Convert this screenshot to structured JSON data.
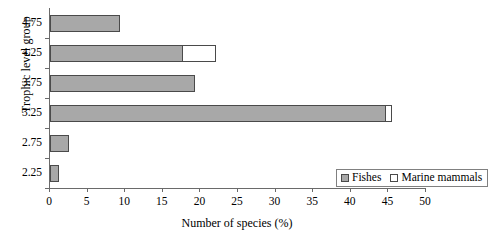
{
  "chart_data": {
    "type": "bar",
    "orientation": "horizontal",
    "stacked": true,
    "title": "",
    "xlabel": "Number of species (%)",
    "ylabel": "Trophic level group",
    "categories": [
      "2.25",
      "2.75",
      "3.25",
      "3.75",
      "4.25",
      "4.75"
    ],
    "series": [
      {
        "name": "Fishes",
        "color": "#a8a8a8",
        "values": [
          1.2,
          2.5,
          44.7,
          19.3,
          17.7,
          9.3
        ]
      },
      {
        "name": "Marine mammals",
        "color": "#ffffff",
        "values": [
          0,
          0,
          0.9,
          0,
          4.5,
          0
        ]
      }
    ],
    "xlim": [
      0,
      50
    ],
    "xticks": [
      0,
      5,
      10,
      15,
      20,
      25,
      30,
      35,
      40,
      45,
      50
    ],
    "xtick_labels": [
      "0",
      "5",
      "10",
      "15",
      "20",
      "25",
      "30",
      "35",
      "40",
      "45",
      "50"
    ],
    "ytick_labels": [
      "4.75",
      "4.25",
      "3.75",
      "3.25",
      "2.75",
      "2.25"
    ],
    "grid": false,
    "legend_position": "bottom-right",
    "legend_entries": [
      "Fishes",
      "Marine mammals"
    ]
  },
  "axes": {
    "x_title": "Number of species (%)",
    "y_title": "Trophic level group"
  },
  "legend": {
    "items": [
      {
        "label": "Fishes"
      },
      {
        "label": "Marine mammals"
      }
    ]
  }
}
